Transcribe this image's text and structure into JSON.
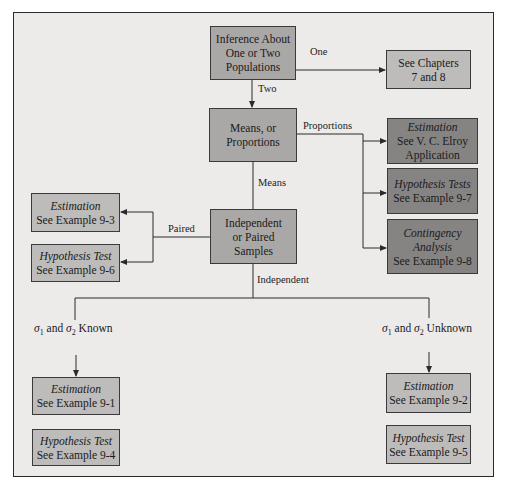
{
  "diagram": {
    "type": "flowchart",
    "nodes": {
      "root": {
        "lines": [
          "Inference About",
          "One or Two",
          "Populations"
        ]
      },
      "chapters": {
        "lines": [
          "See Chapters",
          "7 and 8"
        ]
      },
      "means_props": {
        "lines": [
          "Means, or",
          "Proportions"
        ]
      },
      "prop_est": {
        "title": "Estimation",
        "lines": [
          "See V. C. Elroy",
          "Application"
        ]
      },
      "prop_hyp": {
        "title": "Hypothesis Tests",
        "lines": [
          "See Example 9-7"
        ]
      },
      "prop_cont": {
        "title": "Contingency",
        "title2": "Analysis",
        "lines": [
          "See Example 9-8"
        ]
      },
      "indep_paired": {
        "lines": [
          "Independent",
          "or Paired",
          "Samples"
        ]
      },
      "paired_est": {
        "title": "Estimation",
        "lines": [
          "See Example 9-3"
        ]
      },
      "paired_hyp": {
        "title": "Hypothesis Test",
        "lines": [
          "See Example 9-6"
        ]
      },
      "known_est": {
        "title": "Estimation",
        "lines": [
          "See Example 9-1"
        ]
      },
      "known_hyp": {
        "title": "Hypothesis Test",
        "lines": [
          "See Example 9-4"
        ]
      },
      "unknown_est": {
        "title": "Estimation",
        "lines": [
          "See Example 9-2"
        ]
      },
      "unknown_hyp": {
        "title": "Hypothesis Test",
        "lines": [
          "See Example 9-5"
        ]
      }
    },
    "edge_labels": {
      "one": "One",
      "two": "Two",
      "proportions": "Proportions",
      "means": "Means",
      "paired": "Paired",
      "independent": "Independent",
      "known": {
        "sigma1": "σ",
        "sub1": "1",
        "mid": " and ",
        "sigma2": "σ",
        "sub2": "2",
        "tail": " Known"
      },
      "unknown": {
        "sigma1": "σ",
        "sub1": "1",
        "mid": " and ",
        "sigma2": "σ",
        "sub2": "2",
        "tail": " Unknown"
      }
    },
    "colors": {
      "background": "#ecebea",
      "box_mid": "#a9a8a7",
      "box_light": "#bdbcbb",
      "box_dark": "#858483",
      "line": "#2a2a2a"
    }
  }
}
